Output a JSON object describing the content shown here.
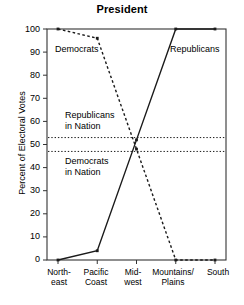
{
  "chart_data": {
    "type": "line",
    "title": "President",
    "xlabel": "",
    "ylabel": "Percent of Electoral Votes",
    "ylim": [
      0,
      100
    ],
    "ytick_values": [
      0,
      10,
      20,
      30,
      40,
      50,
      60,
      70,
      80,
      90,
      100
    ],
    "ytick_labels": [
      "0",
      "10",
      "20",
      "30",
      "40",
      "50",
      "60",
      "70",
      "80",
      "90",
      "100"
    ],
    "categories": [
      "North-\neast",
      "Pacific\nCoast",
      "Mid-\nwest",
      "Mountains/\nPlains",
      "South"
    ],
    "categories_plain": [
      "Northeast",
      "Pacific Coast",
      "Midwest",
      "Mountains/Plains",
      "South"
    ],
    "grid": false,
    "legend_position": "inline-annotations",
    "series": [
      {
        "name": "Democrats",
        "style": "dashed",
        "color": "#1a1a1a",
        "values": [
          100,
          96,
          48,
          0,
          0
        ]
      },
      {
        "name": "Republicans",
        "style": "solid",
        "color": "#1a1a1a",
        "values": [
          0,
          4,
          52,
          100,
          100
        ]
      }
    ],
    "reference_lines": [
      {
        "name": "Republicans in Nation",
        "label": "Republicans\nin Nation",
        "value": 53,
        "style": "dotted",
        "color": "#1a1a1a"
      },
      {
        "name": "Democrats in Nation",
        "label": "Democrats\nin Nation",
        "value": 47,
        "style": "dotted",
        "color": "#1a1a1a"
      }
    ],
    "annotations": [
      {
        "name": "democrats-series-label",
        "text": "Democrats"
      },
      {
        "name": "republicans-series-label",
        "text": "Republicans"
      },
      {
        "name": "republicans-in-nation-label",
        "text": "Republicans\nin Nation"
      },
      {
        "name": "democrats-in-nation-label",
        "text": "Democrats\nin Nation"
      }
    ]
  },
  "colors": {
    "ink": "#1a1a1a",
    "axis": "#333333",
    "background": "#ffffff"
  }
}
